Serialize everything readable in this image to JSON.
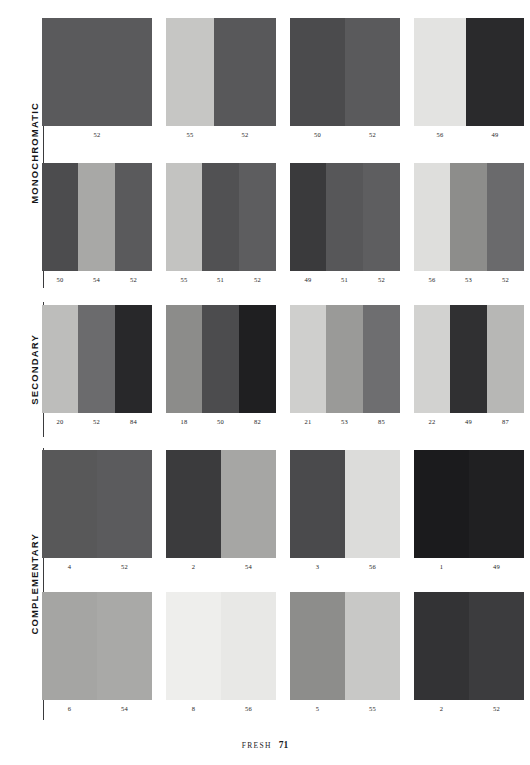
{
  "footer": {
    "book_section": "FRESH",
    "page_number": "71"
  },
  "sections": [
    {
      "id": "monochromatic",
      "label": "MONOCHROMATIC",
      "top": 18,
      "height": 270
    },
    {
      "id": "secondary",
      "label": "SECONDARY",
      "top": 302,
      "height": 135
    },
    {
      "id": "complementary",
      "label": "COMPLEMENTARY",
      "top": 448,
      "height": 272
    }
  ],
  "chart_data": {
    "type": "table",
    "title": "FRESH",
    "rows": [
      {
        "row_index": 0,
        "section": "MONOCHROMATIC",
        "top": 18,
        "cards": [
          {
            "bands": [
              {
                "code": "52",
                "color": "#5a5a5c",
                "width": 110
              }
            ]
          },
          {
            "bands": [
              {
                "code": "55",
                "color": "#c6c6c4",
                "width": 48
              },
              {
                "code": "52",
                "color": "#58585a",
                "width": 62
              }
            ]
          },
          {
            "bands": [
              {
                "code": "50",
                "color": "#4b4b4d",
                "width": 55
              },
              {
                "code": "52",
                "color": "#5a5a5c",
                "width": 55
              }
            ]
          },
          {
            "bands": [
              {
                "code": "56",
                "color": "#e3e3e1",
                "width": 52
              },
              {
                "code": "49",
                "color": "#2a2a2c",
                "width": 58
              }
            ]
          }
        ]
      },
      {
        "row_index": 1,
        "section": "MONOCHROMATIC",
        "top": 163,
        "cards": [
          {
            "bands": [
              {
                "code": "50",
                "color": "#4c4c4e",
                "width": 36
              },
              {
                "code": "54",
                "color": "#a8a8a6",
                "width": 37
              },
              {
                "code": "52",
                "color": "#5a5a5c",
                "width": 37
              }
            ]
          },
          {
            "bands": [
              {
                "code": "55",
                "color": "#c3c3c1",
                "width": 36
              },
              {
                "code": "51",
                "color": "#515153",
                "width": 37
              },
              {
                "code": "52",
                "color": "#5d5d5f",
                "width": 37
              }
            ]
          },
          {
            "bands": [
              {
                "code": "49",
                "color": "#3a3a3c",
                "width": 36
              },
              {
                "code": "51",
                "color": "#575759",
                "width": 37
              },
              {
                "code": "52",
                "color": "#5e5e60",
                "width": 37
              }
            ]
          },
          {
            "bands": [
              {
                "code": "56",
                "color": "#dededc",
                "width": 36
              },
              {
                "code": "53",
                "color": "#8d8d8b",
                "width": 37
              },
              {
                "code": "52",
                "color": "#6a6a6c",
                "width": 37
              }
            ]
          }
        ]
      },
      {
        "row_index": 2,
        "section": "SECONDARY",
        "top": 305,
        "cards": [
          {
            "bands": [
              {
                "code": "20",
                "color": "#bdbdbb",
                "width": 36
              },
              {
                "code": "52",
                "color": "#6b6b6d",
                "width": 37
              },
              {
                "code": "84",
                "color": "#28282a",
                "width": 37
              }
            ]
          },
          {
            "bands": [
              {
                "code": "18",
                "color": "#8c8c8a",
                "width": 36
              },
              {
                "code": "50",
                "color": "#4c4c4e",
                "width": 37
              },
              {
                "code": "82",
                "color": "#1f1f21",
                "width": 37
              }
            ]
          },
          {
            "bands": [
              {
                "code": "21",
                "color": "#cfcfcd",
                "width": 36
              },
              {
                "code": "53",
                "color": "#9a9a98",
                "width": 37
              },
              {
                "code": "85",
                "color": "#6e6e70",
                "width": 37
              }
            ]
          },
          {
            "bands": [
              {
                "code": "22",
                "color": "#d2d2d0",
                "width": 36
              },
              {
                "code": "49",
                "color": "#303032",
                "width": 37
              },
              {
                "code": "87",
                "color": "#b7b7b5",
                "width": 37
              }
            ]
          }
        ]
      },
      {
        "row_index": 3,
        "section": "COMPLEMENTARY",
        "top": 450,
        "cards": [
          {
            "bands": [
              {
                "code": "4",
                "color": "#585859",
                "width": 55
              },
              {
                "code": "52",
                "color": "#5b5b5d",
                "width": 55
              }
            ]
          },
          {
            "bands": [
              {
                "code": "2",
                "color": "#3b3b3d",
                "width": 55
              },
              {
                "code": "54",
                "color": "#a6a6a4",
                "width": 55
              }
            ]
          },
          {
            "bands": [
              {
                "code": "3",
                "color": "#4a4a4c",
                "width": 55
              },
              {
                "code": "56",
                "color": "#dcdcda",
                "width": 55
              }
            ]
          },
          {
            "bands": [
              {
                "code": "1",
                "color": "#1b1b1d",
                "width": 55
              },
              {
                "code": "49",
                "color": "#202022",
                "width": 55
              }
            ]
          }
        ]
      },
      {
        "row_index": 4,
        "section": "COMPLEMENTARY",
        "top": 592,
        "cards": [
          {
            "bands": [
              {
                "code": "6",
                "color": "#a5a5a3",
                "width": 55
              },
              {
                "code": "54",
                "color": "#a9a9a7",
                "width": 55
              }
            ]
          },
          {
            "bands": [
              {
                "code": "8",
                "color": "#eeeeec",
                "width": 55
              },
              {
                "code": "56",
                "color": "#e8e8e6",
                "width": 55
              }
            ]
          },
          {
            "bands": [
              {
                "code": "5",
                "color": "#8d8d8b",
                "width": 55
              },
              {
                "code": "55",
                "color": "#c8c8c6",
                "width": 55
              }
            ]
          },
          {
            "bands": [
              {
                "code": "2",
                "color": "#333335",
                "width": 55
              },
              {
                "code": "52",
                "color": "#3c3c3e",
                "width": 55
              }
            ]
          }
        ]
      }
    ]
  }
}
